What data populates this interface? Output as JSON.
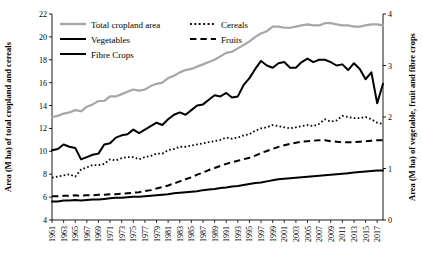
{
  "chart_data": {
    "type": "line",
    "title": "",
    "xlabel": "",
    "ylabel": "Area (M ha) of total cropland and cereals",
    "ylabel_right": "Area (M ha) of vegetable, fruit and fibre crops",
    "ylim": [
      4,
      22
    ],
    "ylim_right": [
      0,
      4
    ],
    "yticks": [
      4,
      6,
      8,
      10,
      12,
      14,
      16,
      18,
      20,
      22
    ],
    "yticks_right": [
      0,
      1,
      2,
      3,
      4
    ],
    "grid": false,
    "legend_position": "top-left",
    "x": [
      1961,
      1962,
      1963,
      1964,
      1965,
      1966,
      1967,
      1968,
      1969,
      1970,
      1971,
      1972,
      1973,
      1974,
      1975,
      1976,
      1977,
      1978,
      1979,
      1980,
      1981,
      1982,
      1983,
      1984,
      1985,
      1986,
      1987,
      1988,
      1989,
      1990,
      1991,
      1992,
      1993,
      1994,
      1995,
      1996,
      1997,
      1998,
      1999,
      2000,
      2001,
      2002,
      2003,
      2004,
      2005,
      2006,
      2007,
      2008,
      2009,
      2010,
      2011,
      2012,
      2013,
      2014,
      2015,
      2016,
      2017,
      2018
    ],
    "xtick_labels": [
      "1961",
      "1963",
      "1965",
      "1967",
      "1969",
      "1971",
      "1973",
      "1975",
      "1977",
      "1979",
      "1981",
      "1983",
      "1985",
      "1987",
      "1989",
      "1991",
      "1993",
      "1995",
      "1997",
      "1999",
      "2001",
      "2003",
      "2005",
      "2007",
      "2009",
      "2011",
      "2013",
      "2015",
      "2017"
    ],
    "series": [
      {
        "name": "Total cropland area",
        "axis": "left",
        "color": "#A6A6A6",
        "style": "solid",
        "width": 2.2,
        "values": [
          13.0,
          13.1,
          13.3,
          13.4,
          13.6,
          13.5,
          13.9,
          14.1,
          14.4,
          14.4,
          14.8,
          14.8,
          15.0,
          15.2,
          15.4,
          15.3,
          15.4,
          15.7,
          15.9,
          16.0,
          16.4,
          16.6,
          16.9,
          17.1,
          17.2,
          17.4,
          17.6,
          17.8,
          18.0,
          18.3,
          18.6,
          18.7,
          19.0,
          19.3,
          19.6,
          20.0,
          20.3,
          20.5,
          20.9,
          20.9,
          20.8,
          20.8,
          20.9,
          21.0,
          21.1,
          21.0,
          21.0,
          21.2,
          21.2,
          21.1,
          21.0,
          21.0,
          20.9,
          20.9,
          21.0,
          21.1,
          21.1,
          21.0
        ]
      },
      {
        "name": "Cereals",
        "axis": "left",
        "color": "#000000",
        "style": "dotted",
        "width": 1.8,
        "values": [
          7.7,
          7.8,
          7.9,
          8.0,
          7.8,
          8.4,
          8.6,
          8.8,
          8.8,
          8.9,
          9.3,
          9.2,
          9.4,
          9.5,
          9.5,
          9.3,
          9.5,
          9.6,
          9.8,
          9.8,
          10.1,
          10.2,
          10.4,
          10.4,
          10.5,
          10.6,
          10.7,
          10.8,
          10.9,
          11.0,
          11.2,
          11.1,
          11.2,
          11.4,
          11.5,
          11.8,
          12.0,
          12.1,
          12.3,
          12.2,
          12.1,
          12.0,
          12.1,
          12.2,
          12.3,
          12.2,
          12.4,
          12.8,
          12.6,
          12.7,
          13.1,
          13.0,
          12.9,
          12.9,
          13.0,
          12.8,
          12.5,
          12.4
        ]
      },
      {
        "name": "Vegetables",
        "axis": "right",
        "color": "#000000",
        "style": "solid",
        "width": 2.0,
        "values": [
          0.36,
          0.36,
          0.38,
          0.38,
          0.39,
          0.38,
          0.39,
          0.4,
          0.4,
          0.41,
          0.42,
          0.43,
          0.43,
          0.44,
          0.45,
          0.45,
          0.46,
          0.47,
          0.48,
          0.49,
          0.5,
          0.52,
          0.53,
          0.54,
          0.55,
          0.56,
          0.58,
          0.59,
          0.6,
          0.62,
          0.63,
          0.65,
          0.66,
          0.68,
          0.7,
          0.72,
          0.73,
          0.75,
          0.77,
          0.79,
          0.8,
          0.81,
          0.82,
          0.83,
          0.84,
          0.85,
          0.86,
          0.87,
          0.88,
          0.89,
          0.9,
          0.91,
          0.92,
          0.93,
          0.94,
          0.95,
          0.96,
          0.96
        ]
      },
      {
        "name": "Fruits",
        "axis": "right",
        "color": "#000000",
        "style": "dashed",
        "width": 2.0,
        "values": [
          0.46,
          0.46,
          0.47,
          0.47,
          0.48,
          0.47,
          0.48,
          0.48,
          0.49,
          0.49,
          0.5,
          0.5,
          0.51,
          0.52,
          0.53,
          0.54,
          0.56,
          0.58,
          0.61,
          0.64,
          0.67,
          0.71,
          0.75,
          0.79,
          0.83,
          0.88,
          0.92,
          0.97,
          1.01,
          1.05,
          1.09,
          1.12,
          1.15,
          1.18,
          1.21,
          1.25,
          1.3,
          1.34,
          1.38,
          1.42,
          1.45,
          1.48,
          1.5,
          1.52,
          1.53,
          1.54,
          1.55,
          1.55,
          1.53,
          1.52,
          1.51,
          1.51,
          1.51,
          1.52,
          1.53,
          1.54,
          1.55,
          1.55
        ]
      },
      {
        "name": "Fibre Crops",
        "axis": "left",
        "color": "#000000",
        "style": "solid",
        "width": 2.0,
        "values": [
          10.1,
          10.2,
          10.6,
          10.4,
          10.3,
          9.3,
          9.5,
          9.7,
          9.8,
          10.6,
          10.7,
          11.2,
          11.4,
          11.5,
          11.9,
          11.6,
          11.9,
          12.2,
          12.5,
          12.3,
          12.8,
          13.2,
          13.4,
          13.2,
          13.6,
          14.0,
          14.1,
          14.5,
          14.9,
          14.8,
          15.1,
          14.7,
          14.8,
          15.8,
          16.4,
          17.2,
          17.9,
          17.5,
          17.3,
          17.7,
          17.8,
          17.3,
          17.3,
          17.8,
          18.1,
          17.8,
          18.0,
          18.0,
          17.8,
          17.5,
          17.6,
          17.1,
          17.7,
          17.2,
          16.3,
          16.9,
          14.2,
          15.9
        ]
      }
    ],
    "legend": [
      {
        "label": "Total cropland area",
        "color": "#A6A6A6",
        "style": "solid"
      },
      {
        "label": "Cereals",
        "color": "#000000",
        "style": "dotted"
      },
      {
        "label": "Vegetables",
        "color": "#000000",
        "style": "solid"
      },
      {
        "label": "Fruits",
        "color": "#000000",
        "style": "dashed"
      },
      {
        "label": "Fibre Crops",
        "color": "#000000",
        "style": "solid"
      }
    ]
  }
}
